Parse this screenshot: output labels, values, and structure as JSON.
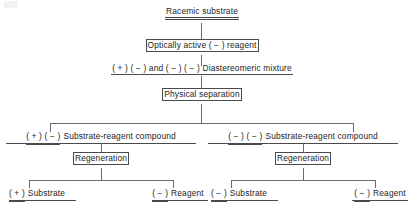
{
  "diagram": {
    "type": "flowchart",
    "colors": {
      "background": "#ffffff",
      "text": "#1c1c1c",
      "line": "#6a6a6a",
      "box_border": "#4a4a4a"
    },
    "nodes": {
      "racemic_substrate": {
        "label": "Racemic substrate",
        "style": "double-underline"
      },
      "reagent": {
        "label": "Optically active ( − ) reagent",
        "style": "box"
      },
      "diastereomeric_mixture": {
        "prefix_a": "( + ) ( − )",
        "connector": "and",
        "prefix_b": "( − ) ( − )",
        "label": "Diastereomeric mixture",
        "full": "( + ) ( − ) and ( − ) ( − ) Diastereomeric mixture",
        "style": "underline"
      },
      "physical_separation": {
        "label": "Physical separation",
        "style": "box"
      },
      "compound_left": {
        "prefix": "( + ) ( − )",
        "label": "Substrate-reagent compound",
        "style": "underline"
      },
      "compound_right": {
        "prefix": "( − ) ( − )",
        "label": "Substrate-reagent compound",
        "style": "underline"
      },
      "regeneration_left": {
        "label": "Regeneration",
        "style": "box"
      },
      "regeneration_right": {
        "label": "Regeneration",
        "style": "box"
      },
      "product_substrate_left": {
        "prefix": "( + )",
        "label": "Substrate",
        "style": "underline"
      },
      "product_reagent_left": {
        "prefix": "( − )",
        "label": "Reagent",
        "style": "underline"
      },
      "product_substrate_right": {
        "prefix": "( − )",
        "label": "Substrate",
        "style": "underline"
      },
      "product_reagent_right": {
        "prefix": "( − )",
        "label": "Reagent",
        "style": "underline"
      }
    },
    "edges": [
      {
        "from": "racemic_substrate",
        "to": "reagent"
      },
      {
        "from": "reagent",
        "to": "diastereomeric_mixture"
      },
      {
        "from": "diastereomeric_mixture",
        "to": "physical_separation"
      },
      {
        "from": "physical_separation",
        "to": "compound_left"
      },
      {
        "from": "physical_separation",
        "to": "compound_right"
      },
      {
        "from": "compound_left",
        "to": "regeneration_left"
      },
      {
        "from": "compound_right",
        "to": "regeneration_right"
      },
      {
        "from": "regeneration_left",
        "to": "product_substrate_left"
      },
      {
        "from": "regeneration_left",
        "to": "product_reagent_left"
      },
      {
        "from": "regeneration_right",
        "to": "product_substrate_right"
      },
      {
        "from": "regeneration_right",
        "to": "product_reagent_right"
      }
    ]
  }
}
